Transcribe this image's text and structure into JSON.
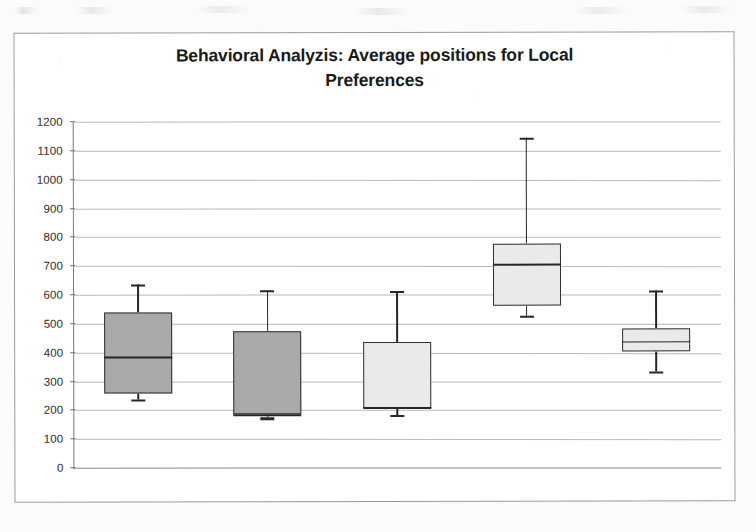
{
  "chart_data": {
    "type": "box",
    "title": "Behavioral Analyzis: Average positions for Local Preferences",
    "title_line1": "Behavioral Analyzis: Average positions for Local",
    "title_line2": "Preferences",
    "xlabel": "",
    "ylabel": "",
    "ylim": [
      0,
      1200
    ],
    "ytick_step": 100,
    "yticks": [
      1200,
      1100,
      1000,
      900,
      800,
      700,
      600,
      500,
      400,
      300,
      200,
      100,
      0
    ],
    "ytick_labels": [
      "1200",
      "1100",
      "1000",
      "900",
      "800",
      "700",
      "600",
      "500",
      "400",
      "300",
      "200",
      "100",
      "0"
    ],
    "grid": true,
    "legend": "none",
    "categories": [
      "Discretized",
      "Linear Regression",
      "M5P",
      "MultilayerPerceptron",
      "SMOreg"
    ],
    "boxes": [
      {
        "category": "Discretized",
        "whisker_low": 235,
        "q1": 258,
        "median": 385,
        "q3": 537,
        "whisker_high": 635,
        "fill": "#a9a9a9"
      },
      {
        "category": "Linear Regression",
        "whisker_low": 172,
        "q1": 185,
        "median": 183,
        "q3": 470,
        "whisker_high": 613,
        "fill": "#a9a9a9"
      },
      {
        "category": "M5P",
        "whisker_low": 182,
        "q1": 205,
        "median": 208,
        "q3": 432,
        "whisker_high": 610,
        "fill": "#eaeaea"
      },
      {
        "category": "MultilayerPerceptron",
        "whisker_low": 525,
        "q1": 560,
        "median": 705,
        "q3": 775,
        "whisker_high": 1140,
        "fill": "#eaeaea"
      },
      {
        "category": "SMOreg",
        "whisker_low": 330,
        "q1": 400,
        "median": 435,
        "q3": 478,
        "whisker_high": 610,
        "fill": "#eaeaea"
      }
    ],
    "colors": {
      "box_fill_dark": "#a9a9a9",
      "box_fill_light": "#eaeaea",
      "box_stroke": "#2e2e2e",
      "gridline": "#b9b9b9",
      "text": "#1a1a1a"
    }
  }
}
